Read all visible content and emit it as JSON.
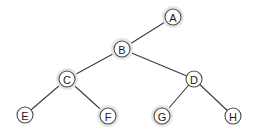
{
  "diagram": {
    "background_color": "#ffffff",
    "node_fill_color": "#ffffff",
    "node_stroke_color": "#4a4a4a",
    "node_halo_color": "#e6e6e6",
    "edge_color": "#3c3c3c",
    "label_color": "#1a1a1a",
    "node_radius": 8,
    "halo_radius": 11,
    "nodes": [
      {
        "id": "A",
        "label": "A",
        "x": 173,
        "y": 17,
        "halo": true
      },
      {
        "id": "B",
        "label": "B",
        "x": 122,
        "y": 49,
        "halo": true
      },
      {
        "id": "C",
        "label": "C",
        "x": 67,
        "y": 79,
        "halo": true
      },
      {
        "id": "D",
        "label": "D",
        "x": 194,
        "y": 79,
        "halo": false
      },
      {
        "id": "E",
        "label": "E",
        "x": 25,
        "y": 115,
        "halo": false
      },
      {
        "id": "F",
        "label": "F",
        "x": 108,
        "y": 116,
        "halo": true
      },
      {
        "id": "G",
        "label": "G",
        "x": 162,
        "y": 116,
        "halo": true
      },
      {
        "id": "H",
        "label": "H",
        "x": 233,
        "y": 116,
        "halo": false
      }
    ],
    "edges": [
      {
        "from": "A",
        "to": "B",
        "x1": 173,
        "y1": 17,
        "x2": 122,
        "y2": 49
      },
      {
        "from": "B",
        "to": "C",
        "x1": 122,
        "y1": 49,
        "x2": 67,
        "y2": 79
      },
      {
        "from": "B",
        "to": "D",
        "x1": 122,
        "y1": 49,
        "x2": 194,
        "y2": 79
      },
      {
        "from": "C",
        "to": "E",
        "x1": 67,
        "y1": 79,
        "x2": 25,
        "y2": 115
      },
      {
        "from": "C",
        "to": "F",
        "x1": 67,
        "y1": 79,
        "x2": 108,
        "y2": 116
      },
      {
        "from": "D",
        "to": "G",
        "x1": 194,
        "y1": 79,
        "x2": 162,
        "y2": 116
      },
      {
        "from": "D",
        "to": "H",
        "x1": 194,
        "y1": 79,
        "x2": 233,
        "y2": 116
      }
    ]
  }
}
